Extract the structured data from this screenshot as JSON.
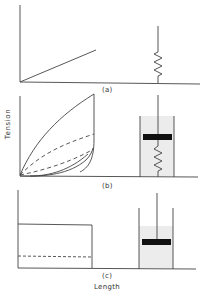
{
  "figure": {
    "panels": [
      {
        "id": "a",
        "label": "(a)",
        "model": "spring (elastic)"
      },
      {
        "id": "b",
        "label": "(b)",
        "model": "spring with dashpot (viscoelastic)"
      },
      {
        "id": "c",
        "label": "(c)",
        "model": "dashpot (viscous)"
      }
    ],
    "ylabel": "Tension",
    "xlabel": "Length"
  },
  "colors": {
    "line": "#444444",
    "fluid": "#ececec",
    "plunger": "#111111"
  }
}
